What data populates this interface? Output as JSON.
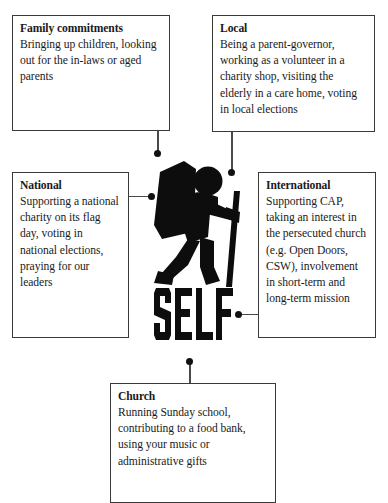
{
  "diagram": {
    "center": {
      "word": "SELF",
      "figure_label": "walking-pilgrim-with-backpack-and-staff"
    },
    "boxes": [
      {
        "id": "family",
        "title": "Family commitments",
        "body": "Bringing up children, looking out for the in-laws or aged parents",
        "lines": [
          "Bringing up children,",
          "looking out for the",
          "in-laws or aged parents"
        ],
        "position": "top-left",
        "connector": "vertical-down-to-center"
      },
      {
        "id": "local",
        "title": "Local",
        "body": "Being a parent-governor, working as a volunteer in a charity shop, visiting the elderly in a care home, voting in local elections",
        "lines": [
          "Being a parent-governor,",
          "working as a volunteer in",
          "a charity shop, visiting the",
          "elderly in a care home,",
          "voting in local elections"
        ],
        "position": "top-right",
        "connector": "vertical-down-to-center"
      },
      {
        "id": "national",
        "title": "National",
        "body": "Supporting a national charity on its flag day, voting in national elections, praying for our leaders",
        "lines": [
          "Supporting a",
          "national charity",
          "on its flag day,",
          "voting in national",
          "elections, praying",
          "for our leaders"
        ],
        "position": "middle-left",
        "connector": "horizontal-right-to-center"
      },
      {
        "id": "international",
        "title": "International",
        "body": "Supporting CAP, taking an interest in the persecuted church (e.g. Open Doors, CSW), involvement in short-term and long-term mission",
        "lines": [
          "Supporting CAP,",
          "taking an interest",
          "in the persecuted",
          "church (e.g. Open",
          "Doors, CSW),",
          "involvement in",
          "short-term and",
          "long-term mission"
        ],
        "position": "middle-right",
        "connector": "horizontal-left-to-center"
      },
      {
        "id": "church",
        "title": "Church",
        "body": "Running Sunday school, contributing to a food bank, using your music or administrative gifts",
        "lines": [
          "Running Sunday school,",
          "contributing to a food",
          "bank, using your music or",
          "administrative gifts"
        ],
        "position": "bottom-center",
        "connector": "vertical-up-to-center"
      }
    ],
    "colors": {
      "ink": "#1a1a1a",
      "box_border": "#3a3a3a",
      "connector": "#4a4a4a",
      "dot": "#111111",
      "background": "#ffffff"
    }
  }
}
